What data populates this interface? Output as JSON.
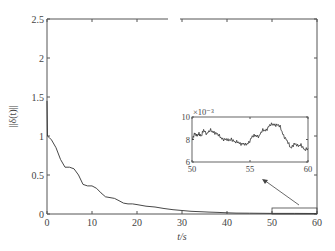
{
  "chart_data": {
    "type": "line",
    "title": "",
    "xlabel": "t/s",
    "ylabel": "||δ(t)||",
    "xlim": [
      0,
      60
    ],
    "ylim": [
      0,
      2.5
    ],
    "xticks": [
      0,
      10,
      20,
      30,
      40,
      50,
      60
    ],
    "yticks": [
      0,
      0.5,
      1,
      1.5,
      2,
      2.5
    ],
    "ytick_labels": [
      "0",
      "0.5",
      "1",
      "1.5",
      "2",
      "2.5"
    ],
    "grid": false,
    "series": [
      {
        "name": "||δ(t)||",
        "color": "#333333",
        "x": [
          0,
          0.1,
          0.5,
          1,
          2,
          3,
          4,
          5,
          6,
          7,
          8,
          9,
          10,
          11,
          12,
          13,
          14,
          15,
          16,
          17,
          18,
          19,
          20,
          22,
          24,
          26,
          28,
          30,
          32,
          34,
          36,
          38,
          40,
          42,
          45,
          50,
          55,
          60
        ],
        "y": [
          1.45,
          1.0,
          0.98,
          0.95,
          0.85,
          0.7,
          0.6,
          0.6,
          0.58,
          0.5,
          0.38,
          0.36,
          0.36,
          0.33,
          0.27,
          0.22,
          0.21,
          0.2,
          0.17,
          0.14,
          0.13,
          0.13,
          0.12,
          0.1,
          0.09,
          0.07,
          0.055,
          0.045,
          0.035,
          0.03,
          0.025,
          0.02,
          0.015,
          0.012,
          0.01,
          0.008,
          0.008,
          0.007
        ]
      }
    ],
    "zoom_box": {
      "x_range": [
        50,
        60
      ],
      "y_range": [
        0,
        0.08
      ]
    },
    "inset": {
      "xlim": [
        50,
        60
      ],
      "ylim": [
        6,
        10
      ],
      "xticks": [
        50,
        55,
        60
      ],
      "yticks": [
        6,
        8,
        10
      ],
      "y_multiplier": "×10⁻³",
      "series": {
        "x": [
          50,
          50.2,
          50.4,
          50.6,
          50.8,
          51,
          51.3,
          51.6,
          51.9,
          52.2,
          52.5,
          52.8,
          53.1,
          53.4,
          53.7,
          54,
          54.3,
          54.6,
          54.9,
          55.2,
          55.5,
          55.8,
          56.1,
          56.4,
          56.7,
          57,
          57.3,
          57.6,
          57.9,
          58.2,
          58.5,
          58.8,
          59.1,
          59.4,
          59.7,
          60
        ],
        "y": [
          8.0,
          8.5,
          8.3,
          8.6,
          8.2,
          8.9,
          8.5,
          8.8,
          8.7,
          8.4,
          8.2,
          8.0,
          7.9,
          8.1,
          7.7,
          7.8,
          7.6,
          7.5,
          7.8,
          8.2,
          8.4,
          8.3,
          8.8,
          8.9,
          9.2,
          9.4,
          9.3,
          9.1,
          8.4,
          7.8,
          7.3,
          7.6,
          7.4,
          7.6,
          7.0,
          7.2
        ]
      }
    },
    "annotations": [
      {
        "type": "rectangle",
        "label": "zoom region 50–60 s"
      },
      {
        "type": "arrow",
        "from": "zoom region",
        "to": "inset"
      }
    ]
  }
}
